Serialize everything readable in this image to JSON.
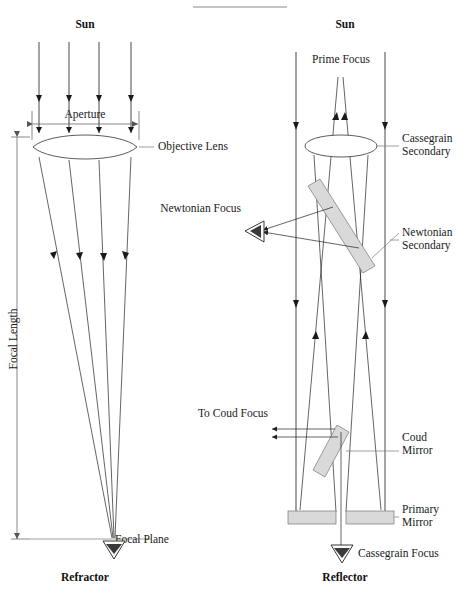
{
  "figure": {
    "title_rule": "horizontal-rule",
    "background_color": "#ffffff",
    "ink_color": "#1a1a1a",
    "mirror_fill": "#d9d9d9"
  },
  "refractor": {
    "source_label": "Sun",
    "aperture_label": "Aperture",
    "objective_label": "Objective Lens",
    "focal_length_label": "Focal Length",
    "focal_plane_label": "Focal Plane",
    "caption": "Refractor",
    "ray_count": 4
  },
  "reflector": {
    "source_label": "Sun",
    "prime_focus_label": "Prime Focus",
    "cassegrain_secondary_label_line1": "Cassegrain",
    "cassegrain_secondary_label_line2": "Secondary",
    "newtonian_focus_label": "Newtonian Focus",
    "newtonian_secondary_label_line1": "Newtonian",
    "newtonian_secondary_label_line2": "Secondary",
    "coude_focus_label": "To Coud  Focus",
    "coude_mirror_label_line1": "Coud",
    "coude_mirror_label_line2": "Mirror",
    "primary_mirror_label_line1": "Primary",
    "primary_mirror_label_line2": "Mirror",
    "cassegrain_focus_label": "Cassegrain Focus",
    "caption": "Reflector",
    "ray_count": 2
  }
}
